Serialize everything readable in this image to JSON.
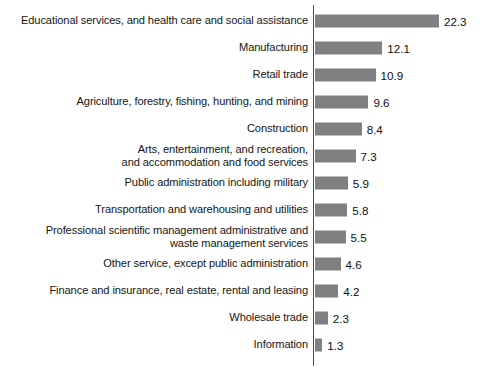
{
  "chart_data": {
    "type": "bar",
    "orientation": "horizontal",
    "title": "",
    "subtitle": "",
    "xlabel": "",
    "ylabel": "",
    "grid": false,
    "legend": null,
    "value_precision": 1,
    "axis_baseline_value": 0,
    "xlim": [
      0,
      22.3
    ],
    "categories": [
      "Educational services, and health care and social assistance",
      "Manufacturing",
      "Retail trade",
      "Agriculture, forestry, fishing, hunting, and mining",
      "Construction",
      "Arts, entertainment, and recreation,\nand accommodation and food services",
      "Public administration including military",
      "Transportation and warehousing and utilities",
      "Professional scientific management administrative and\nwaste management services",
      "Other service, except public administration",
      "Finance and insurance, real estate, rental and leasing",
      "Wholesale trade",
      "Information"
    ],
    "values": [
      22.3,
      12.1,
      10.9,
      9.6,
      8.4,
      7.3,
      5.9,
      5.8,
      5.5,
      4.6,
      4.2,
      2.3,
      1.3
    ],
    "value_labels": [
      "22.3",
      "12.1",
      "10.9",
      "9.6",
      "8.4",
      "7.3",
      "5.9",
      "5.8",
      "5.5",
      "4.6",
      "4.2",
      "2.3",
      "1.3"
    ],
    "colors": {
      "bar": "#808080",
      "axis": "#4a4a4a",
      "text": "#151515",
      "background": "#ffffff"
    }
  },
  "footer": {
    "source_note": ""
  }
}
